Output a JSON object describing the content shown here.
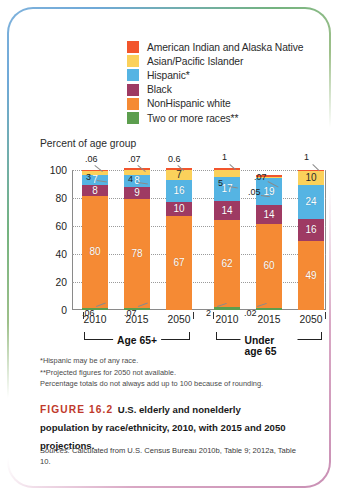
{
  "legend": {
    "items": [
      {
        "label": "American Indian and Alaska Native",
        "color": "#f2552c",
        "key": "aian"
      },
      {
        "label": "Asian/Pacific Islander",
        "color": "#fbd15b",
        "key": "asian"
      },
      {
        "label": "Hispanic*",
        "color": "#55b4e3",
        "key": "hispanic"
      },
      {
        "label": "Black",
        "color": "#9e3a63",
        "key": "black"
      },
      {
        "label": "NonHispanic white",
        "color": "#f58a34",
        "key": "white"
      },
      {
        "label": "Two or more races**",
        "color": "#5c9e4e",
        "key": "two_or_more"
      }
    ]
  },
  "axis_title": "Percent of age group",
  "yticks": [
    "0",
    "20",
    "40",
    "60",
    "80",
    "100"
  ],
  "groups": [
    {
      "label": "Age 65+",
      "years": [
        "2010",
        "2015",
        "2050"
      ]
    },
    {
      "label": "Under age 65",
      "years": [
        "2010",
        "2015",
        "2050"
      ]
    }
  ],
  "footnotes": [
    "*Hispanic may be of any race.",
    "**Projected figures for 2050 not available.",
    "Percentage totals do not always add up to 100 because of rounding."
  ],
  "caption": {
    "figure_number": "FIGURE 16.2",
    "text": "U.S. elderly and nonelderly population by race/ethnicity, 2010, with 2015 and 2050 projections."
  },
  "sources": {
    "label": "Sources:",
    "text": " Calculated from U.S. Census Bureau 2010b, Table 9; 2012a, Table 10."
  },
  "chart_data": {
    "type": "bar",
    "subtype": "stacked-column",
    "title": "U.S. elderly and nonelderly population by race/ethnicity, 2010, with 2015 and 2050 projections.",
    "xlabel": "",
    "ylabel": "Percent of age group",
    "ylim": [
      0,
      100
    ],
    "yticks": [
      0,
      20,
      40,
      60,
      80,
      100
    ],
    "grid": true,
    "legend_position": "top",
    "categories": [
      "Age 65+ 2010",
      "Age 65+ 2015",
      "Age 65+ 2050",
      "Under age 65 2010",
      "Under age 65 2015",
      "Under age 65 2050"
    ],
    "series": [
      {
        "name": "Two or more races**",
        "color": "#5c9e4e",
        "values": [
          0.06,
          0.07,
          null,
          2,
          0.02,
          null
        ],
        "labels": [
          ".06",
          ".07",
          "",
          "2",
          ".02",
          ""
        ]
      },
      {
        "name": "NonHispanic white",
        "color": "#f58a34",
        "values": [
          80,
          78,
          67,
          62,
          60,
          49
        ],
        "labels": [
          "80",
          "78",
          "67",
          "62",
          "60",
          "49"
        ]
      },
      {
        "name": "Black",
        "color": "#9e3a63",
        "values": [
          8,
          9,
          10,
          14,
          14,
          16
        ],
        "labels": [
          "8",
          "9",
          "10",
          "14",
          "14",
          "16"
        ]
      },
      {
        "name": "Hispanic*",
        "color": "#55b4e3",
        "values": [
          7,
          8,
          16,
          17,
          19,
          24
        ],
        "labels": [
          "7",
          "8",
          "16",
          "17",
          "19",
          "24"
        ]
      },
      {
        "name": "Asian/Pacific Islander",
        "color": "#fbd15b",
        "values": [
          3,
          4,
          7,
          5,
          0.05,
          10
        ],
        "labels": [
          "3",
          "4",
          "7",
          "5",
          ".05",
          "10"
        ]
      },
      {
        "name": "American Indian and Alaska Native",
        "color": "#f2552c",
        "values": [
          0.06,
          0.07,
          0.6,
          1,
          0.07,
          1
        ],
        "labels": [
          ".06",
          ".07",
          "0.6",
          "1",
          ".07",
          "1"
        ]
      }
    ]
  }
}
